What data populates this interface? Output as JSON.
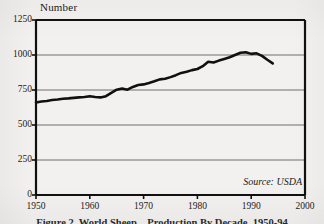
{
  "figure": {
    "axis_title": "Number",
    "source_note": "Source: USDA",
    "caption": "Figure 2. World Sheep... Production By Decade, 1950-94"
  },
  "colors": {
    "paper": "#f2f1ef",
    "ink": "#101010",
    "gridline": "#6e6e6e",
    "axis": "#101010"
  },
  "chart_data": {
    "type": "line",
    "title": "Number",
    "subtitle": "",
    "xlabel": "",
    "ylabel": "Number",
    "xlim": [
      1950,
      2000
    ],
    "ylim": [
      0,
      1250
    ],
    "xticks": [
      1950,
      1960,
      1970,
      1980,
      1990,
      2000
    ],
    "yticks": [
      0,
      250,
      500,
      750,
      1000,
      1250
    ],
    "xtick_labels": [
      "1950",
      "1960",
      "1970",
      "1980",
      "1990",
      "2000"
    ],
    "ytick_labels": [
      "0",
      "250",
      "500",
      "750",
      "1000",
      "1250"
    ],
    "grid": "horizontal",
    "legend": "none",
    "annotations": [
      "Source: USDA"
    ],
    "series": [
      {
        "name": "Number",
        "x": [
          1950,
          1951,
          1952,
          1953,
          1954,
          1955,
          1956,
          1957,
          1958,
          1959,
          1960,
          1961,
          1962,
          1963,
          1964,
          1965,
          1966,
          1967,
          1968,
          1969,
          1970,
          1971,
          1972,
          1973,
          1974,
          1975,
          1976,
          1977,
          1978,
          1979,
          1980,
          1981,
          1982,
          1983,
          1984,
          1985,
          1986,
          1987,
          1988,
          1989,
          1990,
          1991,
          1992,
          1993,
          1994
        ],
        "values": [
          660,
          668,
          672,
          678,
          682,
          688,
          690,
          694,
          697,
          700,
          706,
          700,
          697,
          706,
          730,
          752,
          760,
          752,
          772,
          786,
          790,
          800,
          812,
          826,
          830,
          842,
          856,
          872,
          880,
          892,
          900,
          920,
          952,
          946,
          960,
          972,
          984,
          1000,
          1016,
          1020,
          1008,
          1012,
          994,
          966,
          940
        ]
      }
    ]
  }
}
